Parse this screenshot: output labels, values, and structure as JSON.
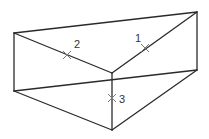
{
  "diagram": {
    "type": "triangular-prism",
    "colors": {
      "edge": "#2a2a2a",
      "marker": "#7a7a7a",
      "label": "#333333",
      "background": "#ffffff"
    },
    "vertices": {
      "top_left": [
        14,
        33
      ],
      "top_right": [
        197,
        12
      ],
      "front_top": [
        112,
        73
      ],
      "bottom_left": [
        14,
        91
      ],
      "bottom_right": [
        197,
        70
      ],
      "front_bottom": [
        112,
        130
      ]
    },
    "edges": [
      {
        "name": "top-back-edge",
        "from": "top_left",
        "to": "top_right"
      },
      {
        "name": "top-left-diagonal",
        "from": "top_left",
        "to": "front_top"
      },
      {
        "name": "top-right-diagonal",
        "from": "front_top",
        "to": "top_right"
      },
      {
        "name": "left-vertical-edge",
        "from": "top_left",
        "to": "bottom_left"
      },
      {
        "name": "right-vertical-edge",
        "from": "top_right",
        "to": "bottom_right"
      },
      {
        "name": "front-vertical-edge",
        "from": "front_top",
        "to": "front_bottom"
      },
      {
        "name": "bottom-back-edge",
        "from": "bottom_left",
        "to": "bottom_right"
      },
      {
        "name": "bottom-left-edge",
        "from": "bottom_left",
        "to": "front_bottom"
      },
      {
        "name": "bottom-right-edge",
        "from": "front_bottom",
        "to": "bottom_right"
      }
    ],
    "markers": [
      {
        "label": "1",
        "x": 145,
        "y": 48,
        "label_x": 135,
        "label_y": 42
      },
      {
        "label": "2",
        "x": 67,
        "y": 55,
        "label_x": 74,
        "label_y": 48
      },
      {
        "label": "3",
        "x": 112,
        "y": 98,
        "label_x": 119,
        "label_y": 103
      }
    ]
  }
}
